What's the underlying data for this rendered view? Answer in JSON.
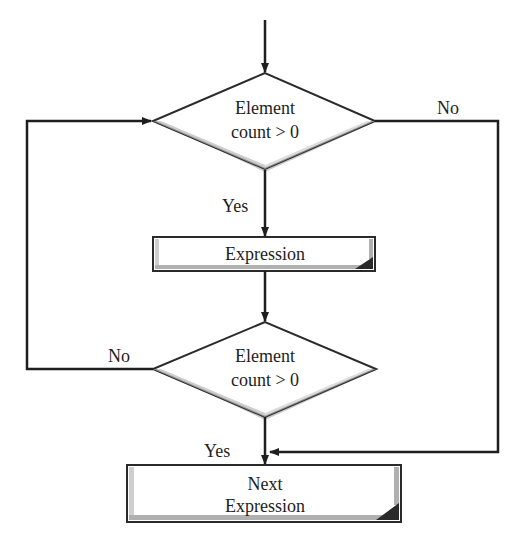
{
  "diagram": {
    "type": "flowchart",
    "nodes": {
      "decision1": {
        "line1": "Element",
        "line2": "count > 0"
      },
      "process1": {
        "label": "Expression"
      },
      "decision2": {
        "line1": "Element",
        "line2": "count > 0"
      },
      "process2": {
        "line1": "Next",
        "line2": "Expression"
      }
    },
    "edges": {
      "decision1_yes": "Yes",
      "decision1_no": "No",
      "decision2_yes": "Yes",
      "decision2_no": "No"
    },
    "colors": {
      "line": "#1e1e1e",
      "shape_fill": "#ffffff",
      "shadow": "#9a9a9a",
      "corner": "#2a2a2a"
    }
  }
}
